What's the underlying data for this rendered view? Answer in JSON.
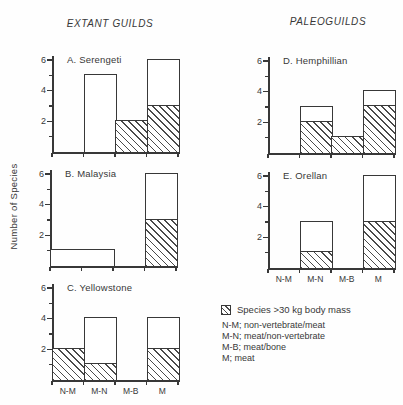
{
  "figure": {
    "left_title": "EXTANT GUILDS",
    "right_title": "PALEOGUILDS",
    "y_axis_label": "Number of Species",
    "ink_color": "#383838",
    "background_color": "#fefefe"
  },
  "legend": {
    "swatch_label": "Species >30 kg body mass",
    "swatch_style": "diagonal-hatch",
    "abbreviations": [
      "N-M; non-vertebrate/meat",
      "M-N; meat/non-vertebrate",
      "M-B; meat/bone",
      "M; meat"
    ]
  },
  "chart_data": {
    "type": "bar",
    "categories": [
      "N-M",
      "M-N",
      "M-B",
      "M"
    ],
    "ylim": [
      0,
      6
    ],
    "yticks": [
      2,
      4,
      6
    ],
    "minor_yticks": [
      1,
      3,
      5
    ],
    "grid": false,
    "legend_position": "bottom-right",
    "hatched_series_meaning": "Species >30 kg body mass",
    "charts": [
      {
        "label": "A. Serengeti",
        "group": "EXTANT GUILDS",
        "totals": [
          0,
          5,
          2,
          6
        ],
        "hatched": [
          0,
          0,
          2,
          3
        ],
        "show_x_labels": false
      },
      {
        "label": "B. Malaysia",
        "group": "EXTANT GUILDS",
        "totals": [
          1,
          1,
          0,
          6
        ],
        "hatched": [
          0,
          0,
          0,
          3
        ],
        "merged_slots": [
          [
            0,
            1
          ]
        ],
        "show_x_labels": false
      },
      {
        "label": "C. Yellowstone",
        "group": "EXTANT GUILDS",
        "totals": [
          2,
          4,
          0,
          4
        ],
        "hatched": [
          2,
          1,
          0,
          2
        ],
        "show_x_labels": true
      },
      {
        "label": "D. Hemphillian",
        "group": "PALEOGUILDS",
        "totals": [
          0,
          3,
          1,
          4
        ],
        "hatched": [
          0,
          2,
          1,
          3
        ],
        "show_x_labels": false
      },
      {
        "label": "E. Orellan",
        "group": "PALEOGUILDS",
        "totals": [
          0,
          3,
          0,
          6
        ],
        "hatched": [
          0,
          1,
          0,
          3
        ],
        "show_x_labels": true
      }
    ]
  }
}
